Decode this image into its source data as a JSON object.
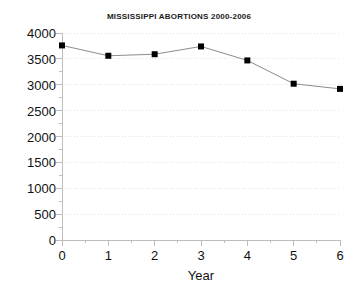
{
  "chart_data": {
    "type": "line",
    "title": "MISSISSIPPI ABORTIONS 2000-2006",
    "xlabel": "Year",
    "ylabel": "",
    "x": [
      0,
      1,
      2,
      3,
      4,
      5,
      6
    ],
    "values": [
      3760,
      3560,
      3590,
      3740,
      3470,
      3020,
      2920
    ],
    "series": [
      {
        "name": "Abortions",
        "values": [
          3760,
          3560,
          3590,
          3740,
          3470,
          3020,
          2920
        ]
      }
    ],
    "xlim": [
      0,
      6
    ],
    "ylim": [
      0,
      4000
    ],
    "xticks": [
      "0",
      "1",
      "2",
      "3",
      "4",
      "5",
      "6"
    ],
    "yticks": [
      "0",
      "500",
      "1000",
      "1500",
      "2000",
      "2500",
      "3000",
      "3500",
      "4000"
    ],
    "ytick_values": [
      0,
      500,
      1000,
      1500,
      2000,
      2500,
      3000,
      3500,
      4000
    ],
    "grid": true,
    "grid_style": "dotted",
    "legend": false,
    "marker": "square",
    "colors": {
      "line": "#8c8c8c",
      "marker": "#000000",
      "grid": "#e2e2e2",
      "axis": "#bdbdbd",
      "text": "#111111",
      "title": "#1a1a1a",
      "background": "#ffffff"
    }
  }
}
